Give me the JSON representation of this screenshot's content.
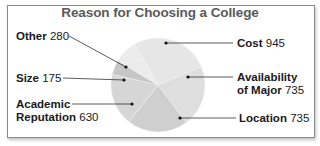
{
  "title": "Reason for Choosing a College",
  "chart_data": {
    "type": "pie",
    "title": "Reason for Choosing a College",
    "categories": [
      "Cost",
      "Availability of Major",
      "Location",
      "Academic Reputation",
      "Size",
      "Other"
    ],
    "values": [
      945,
      735,
      735,
      630,
      175,
      280
    ],
    "total": 3500,
    "colors": [
      "#e6e6e6",
      "#dedede",
      "#cfcfcf",
      "#d6d6d6",
      "#c6c6c6",
      "#ececec"
    ],
    "legend": "none (callout labels)"
  },
  "labels": {
    "other": {
      "name": "Other",
      "value": "280"
    },
    "size": {
      "name": "Size",
      "value": "175"
    },
    "academic": {
      "name_line1": "Academic",
      "name_line2": "Reputation",
      "value": "630"
    },
    "cost": {
      "name": "Cost",
      "value": "945"
    },
    "availability": {
      "name_line1": "Availability",
      "name_line2": "of Major",
      "value": "735"
    },
    "location": {
      "name": "Location",
      "value": "735"
    }
  }
}
